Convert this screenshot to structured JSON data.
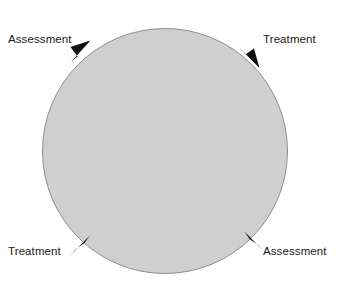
{
  "diagram": {
    "type": "cycle-diagram",
    "circle": {
      "center_x": 165,
      "center_y": 151,
      "radius": 123,
      "fill_color": "#cfcfcf",
      "stroke_color": "#8f8f8f"
    },
    "background_color": "#ffffff",
    "arrow_color": "#111111",
    "flow_direction": "clockwise",
    "labels": [
      {
        "id": "top-left",
        "text": "Assessment",
        "position": "top-left"
      },
      {
        "id": "top-right",
        "text": "Treatment",
        "position": "top-right"
      },
      {
        "id": "bottom-left",
        "text": "Treatment",
        "position": "bottom-left"
      },
      {
        "id": "bottom-right",
        "text": "Assessment",
        "position": "bottom-right"
      }
    ],
    "arrows": [
      {
        "id": "arrow-top-left",
        "points_toward": "up-right",
        "angle_deg": 222
      },
      {
        "id": "arrow-top-right",
        "points_toward": "down-right",
        "angle_deg": 315
      },
      {
        "id": "arrow-bottom-left",
        "points_toward": "up-right",
        "angle_deg": 135
      },
      {
        "id": "arrow-bottom-right",
        "points_toward": "up-left",
        "angle_deg": 45
      }
    ]
  }
}
